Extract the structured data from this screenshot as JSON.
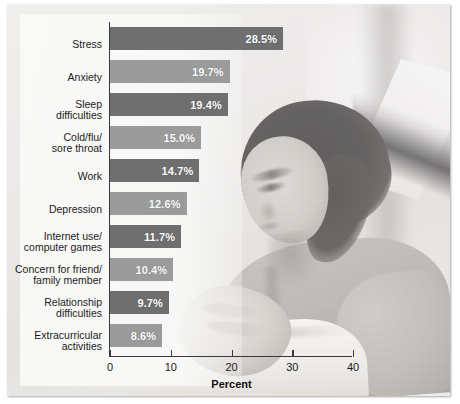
{
  "chart_data": {
    "type": "bar",
    "orientation": "horizontal",
    "title": "",
    "xlabel": "Percent",
    "ylabel": "",
    "xlim": [
      0,
      40
    ],
    "xticks": [
      "0",
      "10",
      "20",
      "30",
      "40"
    ],
    "grid": false,
    "legend": null,
    "value_label_suffix": "%",
    "categories": [
      "Stress",
      "Anxiety",
      "Sleep\ndifficulties",
      "Cold/flu/\nsore throat",
      "Work",
      "Depression",
      "Internet use/\ncomputer games",
      "Concern for friend/\nfamily member",
      "Relationship\ndifficulties",
      "Extracurricular\nactivities"
    ],
    "values": [
      28.5,
      19.7,
      19.4,
      15.0,
      14.7,
      12.6,
      11.7,
      10.4,
      9.7,
      8.6
    ],
    "value_labels": [
      "28.5%",
      "19.7%",
      "19.4%",
      "15.0%",
      "14.7%",
      "12.6%",
      "11.7%",
      "10.4%",
      "9.7%",
      "8.6%"
    ],
    "bar_shades": [
      "dark",
      "light",
      "dark",
      "light",
      "dark",
      "light",
      "dark",
      "light",
      "dark",
      "light"
    ],
    "colors": {
      "bar_dark": "#6f6f6f",
      "bar_light": "#9b9b9b",
      "value_text": "#ffffff",
      "axis": "#3a3a3a",
      "text": "#1b1b1b",
      "panel": "#f9f9f8"
    }
  },
  "background": {
    "description": "black-and-white photograph of a young woman lying down reading an open book"
  }
}
